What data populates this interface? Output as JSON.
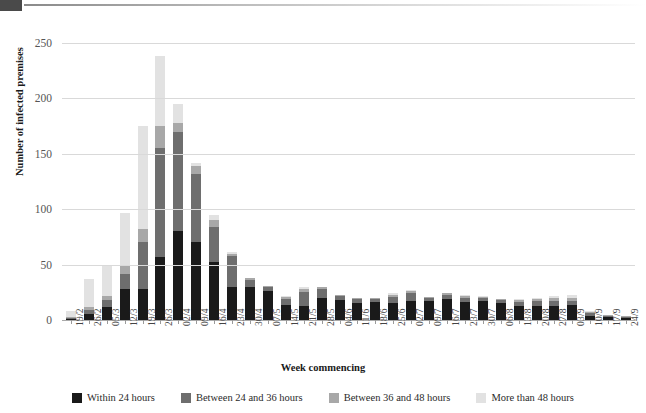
{
  "chart_data": {
    "type": "bar",
    "stacked": true,
    "title": "",
    "xlabel": "Week commencing",
    "ylabel": "Number of infected premises",
    "ylim": [
      0,
      260
    ],
    "yticks": [
      0,
      50,
      100,
      150,
      200,
      250
    ],
    "grid": true,
    "legend_position": "bottom",
    "categories": [
      "19/2",
      "26/2",
      "05/3",
      "12/3",
      "19/3",
      "26/3",
      "02/4",
      "09/4",
      "16/4",
      "23/4",
      "30/4",
      "07/5",
      "14/5",
      "21/5",
      "28/5",
      "04/6",
      "11/6",
      "18/6",
      "25/6",
      "02/7",
      "09/7",
      "16/7",
      "23/7",
      "30/7",
      "06/8",
      "13/8",
      "20/8",
      "27/8",
      "03/9",
      "10/9",
      "17/9",
      "24/9"
    ],
    "series": [
      {
        "name": "Within 24 hours",
        "color": "#1a1a1a",
        "values": [
          1,
          5,
          12,
          28,
          28,
          57,
          80,
          70,
          52,
          30,
          30,
          26,
          14,
          13,
          20,
          18,
          15,
          16,
          15,
          17,
          17,
          19,
          16,
          17,
          15,
          13,
          13,
          13,
          14,
          4,
          3,
          2
        ]
      },
      {
        "name": "Between 24 and 36 hours",
        "color": "#6e6e6e",
        "values": [
          1,
          4,
          6,
          14,
          42,
          98,
          90,
          62,
          32,
          28,
          6,
          4,
          5,
          12,
          8,
          4,
          4,
          3,
          6,
          7,
          3,
          4,
          4,
          3,
          3,
          3,
          4,
          4,
          3,
          2,
          1,
          1
        ]
      },
      {
        "name": "Between 36 and 48 hours",
        "color": "#a8a8a8",
        "values": [
          1,
          3,
          4,
          8,
          12,
          20,
          8,
          7,
          6,
          2,
          2,
          1,
          2,
          3,
          2,
          1,
          1,
          1,
          2,
          2,
          1,
          1,
          2,
          1,
          1,
          2,
          2,
          3,
          3,
          1,
          1,
          1
        ]
      },
      {
        "name": "More than 48 hours",
        "color": "#e2e2e2",
        "values": [
          5,
          25,
          28,
          47,
          93,
          63,
          17,
          3,
          5,
          1,
          0,
          0,
          1,
          2,
          0,
          0,
          0,
          0,
          1,
          1,
          0,
          0,
          1,
          1,
          0,
          1,
          1,
          2,
          3,
          1,
          0,
          0
        ]
      }
    ],
    "totals": [
      8,
      37,
      50,
      97,
      175,
      238,
      195,
      142,
      95,
      61,
      38,
      31,
      22,
      30,
      30,
      23,
      20,
      20,
      24,
      27,
      21,
      24,
      23,
      22,
      19,
      19,
      20,
      22,
      23,
      8,
      5,
      4
    ]
  }
}
